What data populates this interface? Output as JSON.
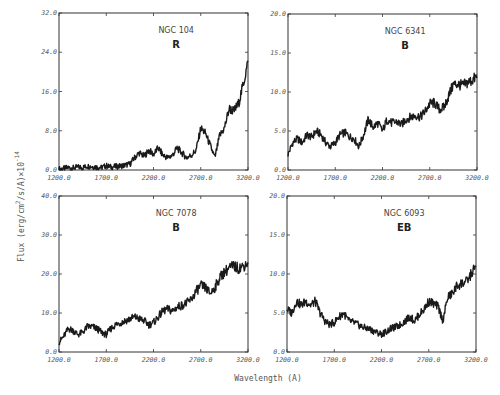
{
  "figure": {
    "xlabel": "Wavelength (A)",
    "ylabel": "Flux (erg/cm",
    "ylabel_sup1": "2",
    "ylabel_mid": "/s/A)×10",
    "ylabel_sup2": "-14"
  },
  "chart_data": [
    {
      "type": "line",
      "title": "NGC 104",
      "class_label": "R",
      "xlabel": "Wavelength (A)",
      "ylabel": "Flux (erg/cm^2/s/A)x10^-14",
      "xlim": [
        1200,
        3200
      ],
      "ylim": [
        0,
        32
      ],
      "xticks": [
        "1200.0",
        "1700.0",
        "2200.0",
        "2700.0",
        "3200.0"
      ],
      "yticks": [
        "0.0",
        "8.0",
        "16.0",
        "24.0",
        "32.0"
      ],
      "grid": false,
      "x": [
        1200,
        1250,
        1300,
        1350,
        1400,
        1450,
        1500,
        1550,
        1600,
        1650,
        1700,
        1750,
        1800,
        1850,
        1900,
        1950,
        2000,
        2050,
        2100,
        2150,
        2200,
        2250,
        2300,
        2350,
        2400,
        2450,
        2500,
        2550,
        2600,
        2650,
        2700,
        2750,
        2800,
        2850,
        2900,
        2950,
        3000,
        3050,
        3100,
        3150,
        3200
      ],
      "values": [
        0.2,
        0.3,
        0.5,
        0.4,
        0.6,
        0.5,
        0.8,
        0.7,
        0.6,
        0.5,
        0.9,
        0.6,
        0.7,
        0.8,
        1.0,
        1.2,
        2.5,
        3.5,
        2.8,
        4.0,
        3.2,
        4.5,
        3.0,
        2.5,
        3.0,
        4.5,
        3.5,
        2.5,
        3.0,
        4.0,
        8.5,
        7.5,
        5.0,
        2.5,
        7.0,
        8.5,
        12.5,
        12.0,
        13.5,
        17.5,
        22.0
      ]
    },
    {
      "type": "line",
      "title": "NGC 6341",
      "class_label": "B",
      "xlabel": "Wavelength (A)",
      "ylabel": "Flux (erg/cm^2/s/A)x10^-14",
      "xlim": [
        1200,
        3200
      ],
      "ylim": [
        0,
        20
      ],
      "xticks": [
        "1200.0",
        "1700.0",
        "2200.0",
        "2700.0",
        "3200.0"
      ],
      "yticks": [
        "0.0",
        "5.0",
        "10.0",
        "15.0",
        "20.0"
      ],
      "grid": false,
      "x": [
        1200,
        1250,
        1300,
        1350,
        1400,
        1450,
        1500,
        1550,
        1600,
        1650,
        1700,
        1750,
        1800,
        1850,
        1900,
        1950,
        2000,
        2050,
        2100,
        2150,
        2200,
        2250,
        2300,
        2350,
        2400,
        2450,
        2500,
        2550,
        2600,
        2650,
        2700,
        2750,
        2800,
        2850,
        2900,
        2950,
        3000,
        3050,
        3100,
        3150,
        3200
      ],
      "values": [
        2.0,
        3.5,
        4.0,
        3.5,
        4.5,
        4.2,
        5.0,
        4.5,
        3.5,
        3.0,
        3.5,
        4.5,
        4.8,
        4.3,
        4.0,
        3.0,
        4.5,
        6.5,
        5.5,
        6.0,
        5.0,
        6.5,
        6.0,
        6.2,
        5.8,
        6.5,
        6.8,
        7.0,
        6.8,
        7.5,
        8.5,
        8.6,
        7.8,
        8.0,
        9.5,
        11.0,
        11.0,
        10.8,
        11.2,
        11.5,
        12.0
      ]
    },
    {
      "type": "line",
      "title": "NGC 7078",
      "class_label": "B",
      "xlabel": "Wavelength (A)",
      "ylabel": "Flux (erg/cm^2/s/A)x10^-14",
      "xlim": [
        1200,
        3200
      ],
      "ylim": [
        0,
        40
      ],
      "xticks": [
        "1200.0",
        "1700.0",
        "2200.0",
        "2700.0",
        "3200.0"
      ],
      "yticks": [
        "0.0",
        "10.0",
        "20.0",
        "30.0",
        "40.0"
      ],
      "grid": false,
      "x": [
        1200,
        1250,
        1300,
        1350,
        1400,
        1450,
        1500,
        1550,
        1600,
        1650,
        1700,
        1750,
        1800,
        1850,
        1900,
        1950,
        2000,
        2050,
        2100,
        2150,
        2200,
        2250,
        2300,
        2350,
        2400,
        2450,
        2500,
        2550,
        2600,
        2650,
        2700,
        2750,
        2800,
        2850,
        2900,
        2950,
        3000,
        3050,
        3100,
        3150,
        3200
      ],
      "values": [
        2.5,
        4.0,
        6.0,
        5.5,
        4.5,
        5.0,
        6.5,
        6.5,
        6.0,
        5.0,
        4.5,
        6.0,
        7.0,
        7.5,
        8.0,
        8.5,
        9.0,
        8.5,
        8.0,
        7.0,
        7.5,
        9.0,
        10.5,
        11.0,
        10.5,
        11.5,
        12.0,
        12.5,
        13.5,
        15.5,
        17.0,
        16.5,
        15.0,
        16.5,
        19.0,
        20.5,
        21.5,
        22.0,
        21.5,
        22.0,
        23.0
      ]
    },
    {
      "type": "line",
      "title": "NGC 6093",
      "class_label": "EB",
      "xlabel": "Wavelength (A)",
      "ylabel": "Flux (erg/cm^2/s/A)x10^-14",
      "xlim": [
        1200,
        3200
      ],
      "ylim": [
        0,
        20
      ],
      "xticks": [
        "1200.0",
        "1700.0",
        "2200.0",
        "2700.0",
        "3200.0"
      ],
      "yticks": [
        "0.0",
        "5.0",
        "10.0",
        "15.0",
        "20.0"
      ],
      "grid": false,
      "x": [
        1200,
        1250,
        1300,
        1350,
        1400,
        1450,
        1500,
        1550,
        1600,
        1650,
        1700,
        1750,
        1800,
        1850,
        1900,
        1950,
        2000,
        2050,
        2100,
        2150,
        2200,
        2250,
        2300,
        2350,
        2400,
        2450,
        2500,
        2550,
        2600,
        2650,
        2700,
        2750,
        2800,
        2850,
        2900,
        2950,
        3000,
        3050,
        3100,
        3150,
        3200
      ],
      "values": [
        5.5,
        5.0,
        6.5,
        6.0,
        6.5,
        6.0,
        6.5,
        5.0,
        4.0,
        3.5,
        3.8,
        4.5,
        5.0,
        4.0,
        3.8,
        3.5,
        3.2,
        3.0,
        2.8,
        2.5,
        2.3,
        2.6,
        3.0,
        3.2,
        3.5,
        4.0,
        4.5,
        4.0,
        4.8,
        5.5,
        6.5,
        6.2,
        5.8,
        4.0,
        7.0,
        7.5,
        8.5,
        8.8,
        9.0,
        10.0,
        11.0
      ]
    }
  ]
}
